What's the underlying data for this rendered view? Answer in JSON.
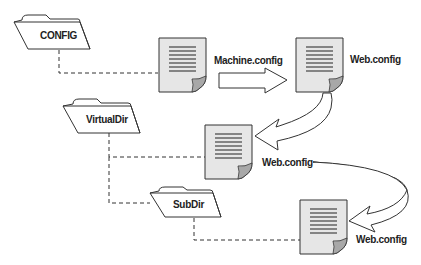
{
  "diagram": {
    "type": "configuration-inheritance-hierarchy",
    "colors": {
      "line": "#333333",
      "doc_fill": "#e6e6e6",
      "doc_fold": "#a8a8a8",
      "arrow_fill": "#ffffff",
      "curl_fill": "#d9d9d9",
      "background": "#ffffff"
    },
    "folders": [
      {
        "label": "CONFIG",
        "icon": "folder-icon"
      },
      {
        "label": "VirtualDir",
        "icon": "folder-icon"
      },
      {
        "label": "SubDir",
        "icon": "folder-icon"
      }
    ],
    "documents": [
      {
        "label": "Machine.config",
        "icon": "document-icon",
        "linked_folder": "CONFIG"
      },
      {
        "label": "Web.config",
        "icon": "document-icon",
        "linked_folder": "CONFIG"
      },
      {
        "label": "Web.config",
        "icon": "document-icon",
        "linked_folder": "VirtualDir"
      },
      {
        "label": "Web.config",
        "icon": "document-icon",
        "linked_folder": "SubDir"
      }
    ],
    "flow": [
      {
        "from": "Machine.config",
        "to": "Web.config (CONFIG)",
        "arrow": "block-arrow"
      },
      {
        "from": "Web.config (CONFIG)",
        "to": "Web.config (VirtualDir)",
        "arrow": "curved-arrow"
      },
      {
        "from": "Web.config (VirtualDir)",
        "to": "Web.config (SubDir)",
        "arrow": "curved-arrow"
      }
    ]
  }
}
